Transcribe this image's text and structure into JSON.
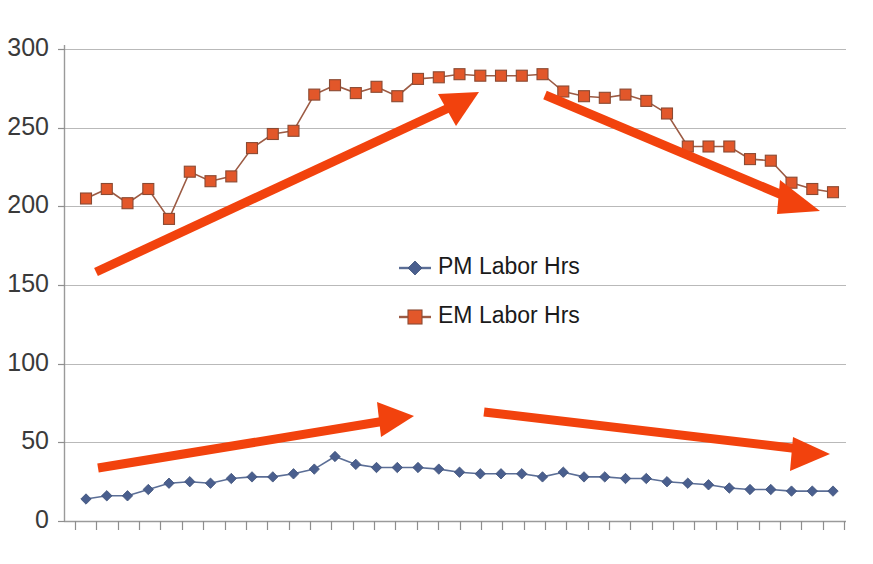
{
  "chart_data": {
    "type": "line",
    "title": "",
    "subtitle": "",
    "xlabel": "",
    "ylabel": "",
    "ylim": [
      0,
      300
    ],
    "ytick_labels": [
      "300",
      "250",
      "200",
      "150",
      "100",
      "50",
      "0"
    ],
    "ytick_values": [
      300,
      250,
      200,
      150,
      100,
      50,
      0
    ],
    "grid": true,
    "xtick_labels": [],
    "xtick_count": 37,
    "legend_position": "center",
    "legend": [
      {
        "name": "PM Labor Hrs",
        "marker": "diamond",
        "color": "#4a5f8e"
      },
      {
        "name": "EM Labor Hrs",
        "marker": "square",
        "color": "#e2572a"
      }
    ],
    "x": [
      1,
      2,
      3,
      4,
      5,
      6,
      7,
      8,
      9,
      10,
      11,
      12,
      13,
      14,
      15,
      16,
      17,
      18,
      19,
      20,
      21,
      22,
      23,
      24,
      25,
      26,
      27,
      28,
      29,
      30,
      31,
      32,
      33,
      34,
      35,
      36,
      37
    ],
    "series": [
      {
        "name": "PM Labor Hrs",
        "color": "#4a5f8e",
        "marker": "diamond",
        "values": [
          14,
          16,
          16,
          20,
          24,
          25,
          24,
          27,
          28,
          28,
          30,
          33,
          41,
          36,
          34,
          34,
          34,
          33,
          31,
          30,
          30,
          30,
          28,
          31,
          28,
          28,
          27,
          27,
          25,
          24,
          23,
          21,
          20,
          20,
          19,
          19,
          19
        ]
      },
      {
        "name": "EM Labor Hrs",
        "color": "#e2572a",
        "marker": "square",
        "values": [
          205,
          211,
          202,
          211,
          192,
          222,
          216,
          219,
          237,
          246,
          248,
          271,
          277,
          272,
          276,
          270,
          281,
          282,
          284,
          283,
          283,
          283,
          284,
          273,
          270,
          269,
          271,
          267,
          259,
          238,
          238,
          238,
          230,
          229,
          215,
          211,
          209
        ]
      }
    ],
    "annotations": [
      {
        "id": "arrow-em-up",
        "label": "rising trend EM",
        "direction": "up",
        "color": "#f2420d"
      },
      {
        "id": "arrow-em-down",
        "label": "falling trend EM",
        "direction": "down",
        "color": "#f2420d"
      },
      {
        "id": "arrow-pm-up",
        "label": "rising trend PM",
        "direction": "up",
        "color": "#f2420d"
      },
      {
        "id": "arrow-pm-down",
        "label": "falling trend PM",
        "direction": "down",
        "color": "#f2420d"
      }
    ]
  }
}
